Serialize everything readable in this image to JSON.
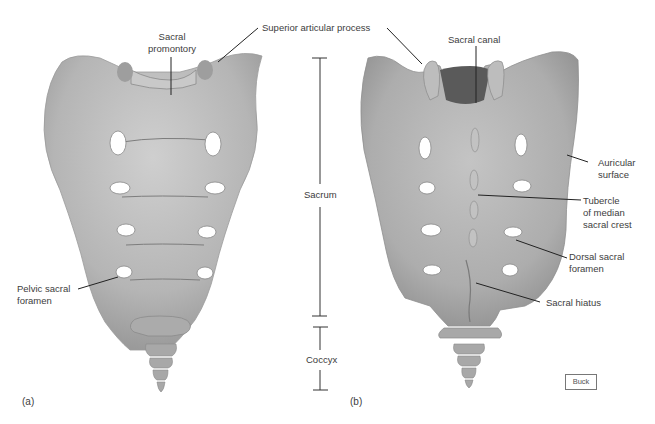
{
  "figure": {
    "panels": [
      {
        "id": "a",
        "label": "(a)",
        "view": "anterior"
      },
      {
        "id": "b",
        "label": "(b)",
        "view": "posterior"
      }
    ],
    "credit": "Buck",
    "colors": {
      "bone": "#b9b9b9",
      "bone_dark": "#8f8f8f",
      "bone_light": "#d4d4d4",
      "foramen": "#ffffff",
      "leader": "#222222",
      "text": "#3d3d3d"
    }
  },
  "labels": {
    "sacral_promontory": "Sacral\npromontory",
    "superior_articular_process": "Superior articular process",
    "pelvic_sacral_foramen": "Pelvic sacral\nforamen",
    "sacral_canal": "Sacral canal",
    "auricular_surface": "Auricular\nsurface",
    "tubercle_median_sacral_crest": "Tubercle\nof median\nsacral crest",
    "dorsal_sacral_foramen": "Dorsal sacral\nforamen",
    "sacral_hiatus": "Sacral hiatus"
  },
  "brackets": {
    "sacrum": "Sacrum",
    "coccyx": "Coccyx"
  }
}
